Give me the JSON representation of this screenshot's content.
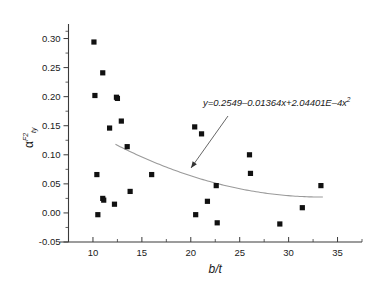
{
  "chart_data": {
    "type": "scatter",
    "title": "",
    "xlabel": "b/t",
    "ylabel_symbol": "α",
    "ylabel_sup": "F2",
    "ylabel_sub": "ty",
    "xlim": [
      7.5,
      37.5
    ],
    "ylim": [
      -0.05,
      0.325
    ],
    "xticks": [
      10,
      15,
      20,
      25,
      30,
      35
    ],
    "xtick_labels": [
      "10",
      "15",
      "20",
      "25",
      "30",
      "35"
    ],
    "yticks": [
      -0.05,
      0.0,
      0.05,
      0.1,
      0.15,
      0.2,
      0.25,
      0.3
    ],
    "ytick_labels": [
      "-0.05",
      "0.00",
      "0.05",
      "0.10",
      "0.15",
      "0.20",
      "0.25",
      "0.30"
    ],
    "grid": false,
    "legend": "none",
    "marker": "filled-square",
    "marker_color": "#111111",
    "fit_color": "#9a9a9a",
    "points": [
      {
        "x": 10.1,
        "y": 0.294
      },
      {
        "x": 10.2,
        "y": 0.202
      },
      {
        "x": 10.4,
        "y": 0.066
      },
      {
        "x": 10.5,
        "y": -0.003
      },
      {
        "x": 11.0,
        "y": 0.241
      },
      {
        "x": 11.0,
        "y": 0.025
      },
      {
        "x": 11.1,
        "y": 0.022
      },
      {
        "x": 11.7,
        "y": 0.146
      },
      {
        "x": 12.2,
        "y": 0.015
      },
      {
        "x": 12.4,
        "y": 0.199
      },
      {
        "x": 12.5,
        "y": 0.197
      },
      {
        "x": 12.9,
        "y": 0.158
      },
      {
        "x": 13.5,
        "y": 0.114
      },
      {
        "x": 13.8,
        "y": 0.037
      },
      {
        "x": 16.0,
        "y": 0.066
      },
      {
        "x": 20.4,
        "y": 0.148
      },
      {
        "x": 20.5,
        "y": -0.003
      },
      {
        "x": 21.1,
        "y": 0.136
      },
      {
        "x": 21.7,
        "y": 0.02
      },
      {
        "x": 22.6,
        "y": 0.047
      },
      {
        "x": 22.7,
        "y": -0.017
      },
      {
        "x": 26.0,
        "y": 0.1
      },
      {
        "x": 26.1,
        "y": 0.068
      },
      {
        "x": 29.1,
        "y": -0.019
      },
      {
        "x": 31.4,
        "y": 0.009
      },
      {
        "x": 33.3,
        "y": 0.047
      }
    ],
    "fit": {
      "equation_text": "y=0.2549–0.01364x+2.04401E–4x",
      "equation_exponent": "2",
      "coefficients": {
        "a": 0.2549,
        "b": -0.01364,
        "c": 0.000204401
      },
      "x_start": 12.3,
      "x_end": 33.5
    },
    "annotation": {
      "leader_from_x": 228,
      "leader_from_y": 116,
      "leader_to_x": 191,
      "leader_to_y": 168
    }
  }
}
